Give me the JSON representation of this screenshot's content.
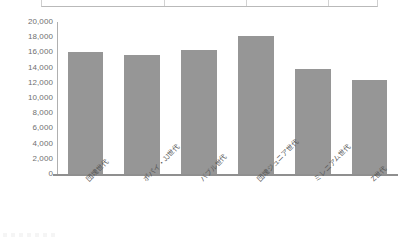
{
  "chart_data": {
    "type": "bar",
    "title": "",
    "xlabel": "",
    "ylabel": "",
    "categories": [
      "団塊世代",
      "ポパイ・JJ世代",
      "バブル世代",
      "団塊ジュニア世代",
      "ミレニアム世代",
      "Z世代"
    ],
    "values": [
      16100,
      15700,
      16300,
      18200,
      13800,
      12400
    ],
    "ylim": [
      0,
      20000
    ],
    "ytick_step": 2000,
    "ytick_labels": [
      "20,000",
      "18,000",
      "16,000",
      "14,000",
      "12,000",
      "10,000",
      "8,000",
      "6,000",
      "4,000",
      "2,000",
      "0"
    ],
    "ytick_values": [
      20000,
      18000,
      16000,
      14000,
      12000,
      10000,
      8000,
      6000,
      4000,
      2000,
      0
    ],
    "grid": false,
    "legend": false,
    "legend_position": "none",
    "series": [
      {
        "name": "",
        "color": "#969696",
        "values": [
          16100,
          15700,
          16300,
          18200,
          13800,
          12400
        ]
      }
    ],
    "bar_color": "#969696",
    "axis_color": "#8f8f8f",
    "label_color": "#6f6f6f",
    "xlabel_rotation": -45
  }
}
